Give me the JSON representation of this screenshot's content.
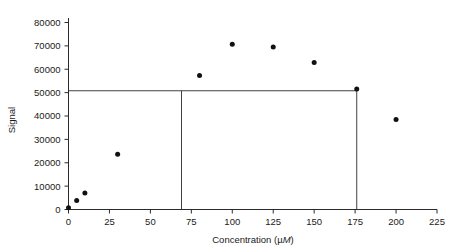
{
  "chart_data": {
    "type": "scatter",
    "title": "",
    "xlabel": "Concentration (µM)",
    "ylabel": "Signal",
    "xlim": [
      0,
      225
    ],
    "ylim": [
      0,
      80000
    ],
    "xticks": [
      0,
      25,
      50,
      75,
      100,
      125,
      150,
      175,
      200,
      225
    ],
    "xtick_labels": [
      "0",
      "25",
      "50",
      "75",
      "100",
      "125",
      "150",
      "175",
      "200",
      "225"
    ],
    "yticks": [
      0,
      10000,
      20000,
      30000,
      40000,
      50000,
      60000,
      70000,
      80000
    ],
    "ytick_labels": [
      "0",
      "10000",
      "20000",
      "30000",
      "40000",
      "50000",
      "60000",
      "70000",
      "80000"
    ],
    "grid": false,
    "legend": null,
    "marker": "filled-circle",
    "marker_color": "#111111",
    "x": [
      0,
      5,
      10,
      30,
      80,
      100,
      125,
      150,
      176,
      200
    ],
    "y": [
      700,
      3800,
      7100,
      23600,
      57300,
      70700,
      69500,
      62900,
      51500,
      38500
    ],
    "points": [
      {
        "x": 0,
        "y": 700
      },
      {
        "x": 5,
        "y": 3800
      },
      {
        "x": 10,
        "y": 7100
      },
      {
        "x": 30,
        "y": 23600
      },
      {
        "x": 80,
        "y": 57300
      },
      {
        "x": 100,
        "y": 70700
      },
      {
        "x": 125,
        "y": 69500
      },
      {
        "x": 150,
        "y": 62900
      },
      {
        "x": 176,
        "y": 51500
      },
      {
        "x": 200,
        "y": 38500
      }
    ],
    "annotations": [
      {
        "name": "signal-level-line",
        "type": "hline",
        "y": 50800,
        "x_start": 0,
        "x_end": 176
      },
      {
        "name": "lower-concentration-line",
        "type": "vline",
        "x": 69,
        "y_start": 0,
        "y_end": 50800
      },
      {
        "name": "upper-concentration-line",
        "type": "vline",
        "x": 176,
        "y_start": 0,
        "y_end": 50800
      }
    ],
    "axis_color": "#2b2b2b",
    "background_color": "#ffffff"
  }
}
